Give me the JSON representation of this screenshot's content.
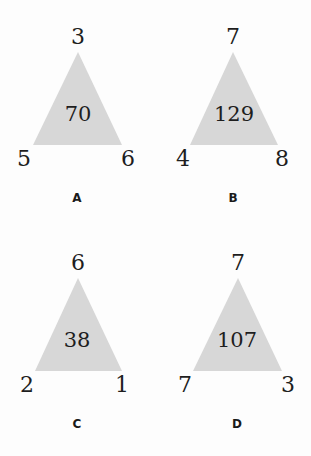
{
  "colors": {
    "triangle_fill": "#d7d7d7",
    "text": "#1e1e1e",
    "background": "#fdfdfd"
  },
  "puzzles": [
    {
      "label": "A",
      "top": "3",
      "left": "5",
      "right": "6",
      "center": "70"
    },
    {
      "label": "B",
      "top": "7",
      "left": "4",
      "right": "8",
      "center": "129"
    },
    {
      "label": "C",
      "top": "6",
      "left": "2",
      "right": "1",
      "center": "38"
    },
    {
      "label": "D",
      "top": "7",
      "left": "7",
      "right": "3",
      "center": "107"
    }
  ]
}
